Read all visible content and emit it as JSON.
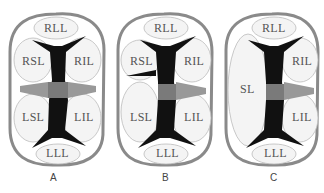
{
  "figure": {
    "panels": [
      {
        "id": "A",
        "letter": "A",
        "lobes": {
          "top": "RLL",
          "upper_left": "RSL",
          "upper_right": "RIL",
          "lower_left": "LSL",
          "lower_right": "LIL",
          "bottom": "LLL"
        }
      },
      {
        "id": "B",
        "letter": "B",
        "lobes": {
          "top": "RLL",
          "upper_left": "RSL",
          "upper_right": "RIL",
          "lower_left": "LSL",
          "lower_right": "LIL",
          "bottom": "LLL"
        }
      },
      {
        "id": "C",
        "letter": "C",
        "lobes": {
          "top": "RLL",
          "left": "SL",
          "upper_right": "RIL",
          "lower_right": "LIL",
          "bottom": "LLL"
        }
      }
    ],
    "colors": {
      "outline": "#8a8a8a",
      "lobe_fill": "#f4f4f4",
      "septum": "#111111",
      "center_block": "#7a7a7a"
    }
  }
}
